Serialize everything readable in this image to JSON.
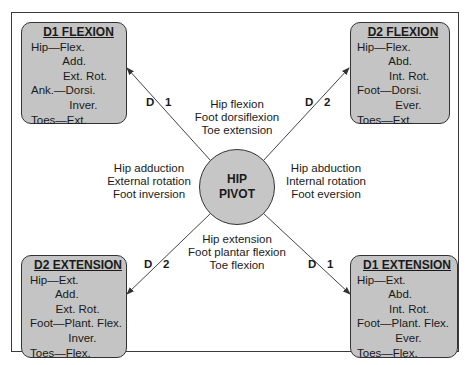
{
  "pivot": {
    "line1": "HIP",
    "line2": "PIVOT"
  },
  "boxes": {
    "d1_flexion": {
      "title": "D1 FLEXION",
      "lines": [
        "Hip—Flex.",
        "          Add.",
        "          Ext. Rot.",
        "Ank.—Dorsi.",
        "            Inver.",
        "Toes—Ext."
      ]
    },
    "d2_flexion": {
      "title": "D2 FLEXION",
      "lines": [
        "Hip—Flex.",
        "          Abd.",
        "          Int. Rot.",
        "Foot—Dorsi.",
        "            Ever.",
        "Toes—Ext."
      ]
    },
    "d2_extension": {
      "title": "D2 EXTENSION",
      "lines": [
        "Hip—Ext.",
        "        Add.",
        "        Ext. Rot.",
        "Foot—Plant. Flex.",
        "            Inver.",
        "Toes—Flex."
      ]
    },
    "d1_extension": {
      "title": "D1 EXTENSION",
      "lines": [
        "Hip—Ext.",
        "          Abd.",
        "          Int. Rot.",
        "Foot—Plant. Flex.",
        "            Ever.",
        "Toes—Flex."
      ]
    }
  },
  "motions": {
    "top": [
      "Hip flexion",
      "Foot dorsiflexion",
      "Toe extension"
    ],
    "bottom": [
      "Hip extension",
      "Foot plantar flexion",
      "Toe flexion"
    ],
    "left": [
      "Hip adduction",
      "External rotation",
      "Foot inversion"
    ],
    "right": [
      "Hip abduction",
      "Internal rotation",
      "Foot eversion"
    ]
  },
  "diagonal_labels": {
    "tl": {
      "d": "D",
      "n": "1"
    },
    "tr": {
      "d": "D",
      "n": "2"
    },
    "bl": {
      "d": "D",
      "n": "2"
    },
    "br": {
      "d": "D",
      "n": "1"
    }
  },
  "colors": {
    "box_fill": "#c4c4c4",
    "pivot_fill": "#c6c6c6",
    "stroke": "#333333"
  }
}
